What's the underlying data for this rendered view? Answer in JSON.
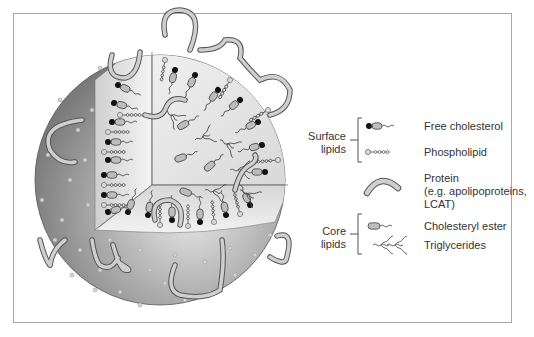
{
  "figure": {
    "type": "lipoprotein particle cutaway diagram",
    "background": "#ffffff",
    "frame_color": "#a8a8a8"
  },
  "legend": {
    "groups": [
      {
        "label_line1": "Surface",
        "label_line2": "lipids"
      },
      {
        "label_line1": "Core",
        "label_line2": "lipids"
      }
    ],
    "items": [
      {
        "label": "Free cholesterol",
        "icon": "free-cholesterol-icon",
        "group": "Surface lipids"
      },
      {
        "label": "Phospholipid",
        "icon": "phospholipid-icon",
        "group": "Surface lipids"
      },
      {
        "label_line1": "Protein",
        "label_line2": "(e.g. apolipoproteins,",
        "label_line3": "LCAT)",
        "icon": "protein-icon",
        "group": ""
      },
      {
        "label": "Cholesteryl ester",
        "icon": "cholesteryl-ester-icon",
        "group": "Core lipids"
      },
      {
        "label": "Triglycerides",
        "icon": "triglycerides-icon",
        "group": "Core lipids"
      }
    ]
  },
  "colors": {
    "sphere_dark": "#6e6e6e",
    "sphere_mid": "#a0a0a0",
    "sphere_light": "#e6e6e6",
    "protein_fill": "#c8c8c8",
    "protein_outline": "#555555",
    "cholesterol_head": "#111111",
    "phospholipid_head": "#d0d0d0"
  }
}
